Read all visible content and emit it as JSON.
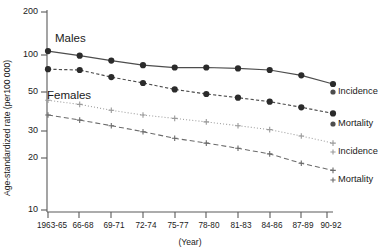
{
  "chart_data": {
    "type": "line",
    "title": "",
    "xlabel": "(Year)",
    "ylabel": "Age-standardized rate (per100 000)",
    "yscale": "log",
    "ylim": [
      10,
      200
    ],
    "yticks": [
      10,
      20,
      30,
      50,
      100,
      200
    ],
    "ytick_labels": [
      "10",
      "20",
      "30",
      "50",
      "100",
      "200"
    ],
    "grid": false,
    "legend_position": "right-of-plot-inline",
    "categories": [
      "1963-65",
      "66-68",
      "69-71",
      "72-74",
      "75-77",
      "78-80",
      "81-83",
      "84-86",
      "87-89",
      "90-92"
    ],
    "annotations": [
      {
        "text": "Males",
        "x": "1963-65",
        "y": 150
      },
      {
        "text": "Females",
        "x": "1963-65",
        "y": 62
      }
    ],
    "series": [
      {
        "name": "Incidence",
        "group": "Males",
        "marker": "filled-circle",
        "linestyle": "solid",
        "color": "#4d4d4d",
        "end_label": "Incidence",
        "values": [
          106,
          99,
          92,
          86,
          83,
          83,
          82,
          80,
          74,
          65
        ]
      },
      {
        "name": "Mortality",
        "group": "Males",
        "marker": "filled-circle",
        "linestyle": "dotted-dashed",
        "color": "#4d4d4d",
        "end_label": "Mortality",
        "values": [
          81,
          80,
          72,
          66,
          60,
          56,
          53,
          50,
          46,
          42
        ]
      },
      {
        "name": "Incidence",
        "group": "Females",
        "marker": "plus",
        "linestyle": "dotted",
        "color": "#9a9a9a",
        "end_label": "Incidence",
        "values": [
          51,
          48,
          44,
          41,
          39,
          37,
          35,
          33,
          30,
          27
        ]
      },
      {
        "name": "Mortality",
        "group": "Females",
        "marker": "plus",
        "linestyle": "dashed",
        "color": "#6b6b6b",
        "end_label": "Mortality",
        "values": [
          41,
          38,
          35,
          32,
          29,
          27,
          25,
          23,
          20,
          18
        ]
      }
    ]
  },
  "labels": {
    "ytick_0": "200",
    "ytick_1": "100",
    "ytick_2": "50",
    "ytick_3": "30",
    "ytick_4": "20",
    "ytick_5": "10",
    "xtick_0": "1963-65",
    "xtick_1": "66-68",
    "xtick_2": "69-71",
    "xtick_3": "72-74",
    "xtick_4": "75-77",
    "xtick_5": "78-80",
    "xtick_6": "81-83",
    "xtick_7": "84-86",
    "xtick_8": "87-89",
    "xtick_9": "90-92",
    "xaxis_title": "(Year)",
    "yaxis_title": "Age-standardized rate (per100 000)",
    "group_males": "Males",
    "group_females": "Females",
    "legend_males_incidence": "Incidence",
    "legend_males_mortality": "Mortality",
    "legend_females_incidence": "Incidence",
    "legend_females_mortality": "Mortality"
  }
}
